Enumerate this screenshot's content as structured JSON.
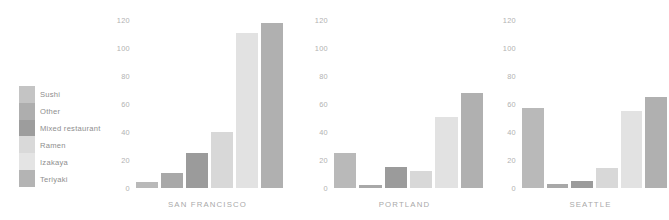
{
  "chart_data": {
    "type": "bar",
    "title": "",
    "subtitle": "",
    "xlabel": "",
    "ylabel": "",
    "ylim": [
      0,
      125
    ],
    "grid": false,
    "legend_position": "left",
    "yticks": [
      "120",
      "100",
      "80",
      "60",
      "40",
      "20",
      "0"
    ],
    "ytick_values": [
      120,
      100,
      80,
      60,
      40,
      20,
      0
    ],
    "categories": [
      "Sushi",
      "Other",
      "Mixed restaurant",
      "Ramen",
      "Izakaya",
      "Teriyaki"
    ],
    "panels": [
      {
        "name": "SAN FRANCISCO",
        "values": [
          4,
          11,
          25,
          40,
          111,
          118
        ]
      },
      {
        "name": "PORTLAND",
        "values": [
          25,
          2,
          15,
          12,
          51,
          68
        ]
      },
      {
        "name": "SEATTLE",
        "values": [
          57,
          3,
          5,
          14,
          55,
          65
        ]
      }
    ],
    "series_colors": [
      "#b9b9b9",
      "#a8a8a8",
      "#9b9b9b",
      "#d8d8d8",
      "#e2e2e2",
      "#b0b0b0"
    ]
  },
  "legend": {
    "items": [
      {
        "label": "Sushi",
        "color": "#c4c4c4"
      },
      {
        "label": "Other",
        "color": "#aeaeae"
      },
      {
        "label": "Mixed restaurant",
        "color": "#9d9d9d"
      },
      {
        "label": "Ramen",
        "color": "#d9d9d9"
      },
      {
        "label": "Izakaya",
        "color": "#e4e4e4"
      },
      {
        "label": "Teriyaki",
        "color": "#b4b4b4"
      }
    ]
  },
  "axis": {
    "tick_color": "#b2b2b2",
    "label_color": "#a9a9a9"
  }
}
